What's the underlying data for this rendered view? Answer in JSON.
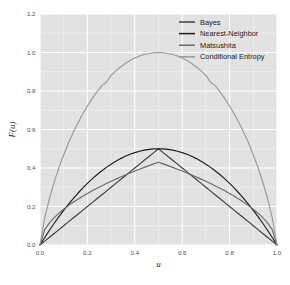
{
  "chart_data": {
    "type": "line",
    "title": "",
    "subtitle": "",
    "xlabel": "u",
    "ylabel": "F(u)",
    "xlim": [
      0.0,
      1.0
    ],
    "ylim": [
      0.0,
      1.2
    ],
    "xticks": [
      "0.0",
      "0.2",
      "0.4",
      "0.6",
      "0.8",
      "1.0"
    ],
    "xtick_values": [
      0.0,
      0.2,
      0.4,
      0.6,
      0.8,
      1.0
    ],
    "yticks": [
      "0.0",
      "0.2",
      "0.4",
      "0.6",
      "0.8",
      "1.0",
      "1.2"
    ],
    "ytick_values": [
      0.0,
      0.2,
      0.4,
      0.6,
      0.8,
      1.0,
      1.2
    ],
    "grid": true,
    "grid_color": "#ffffff",
    "panel_background": "#e2e2e2",
    "legend_position": "top-right-inside",
    "x": [
      0.0,
      0.02,
      0.04,
      0.06,
      0.08,
      0.1,
      0.12,
      0.14,
      0.16,
      0.18,
      0.2,
      0.22,
      0.24,
      0.26,
      0.28,
      0.3,
      0.32,
      0.34,
      0.36,
      0.38,
      0.4,
      0.42,
      0.44,
      0.46,
      0.48,
      0.5,
      0.52,
      0.54,
      0.56,
      0.58,
      0.6,
      0.62,
      0.64,
      0.66,
      0.68,
      0.7,
      0.72,
      0.74,
      0.76,
      0.78,
      0.8,
      0.82,
      0.84,
      0.86,
      0.88,
      0.9,
      0.92,
      0.94,
      0.96,
      0.98,
      1.0
    ],
    "series": [
      {
        "name": "Bayes",
        "color": "#3f3f3f",
        "values": [
          0.0,
          0.02,
          0.04,
          0.06,
          0.08,
          0.1,
          0.12,
          0.14,
          0.16,
          0.18,
          0.2,
          0.22,
          0.24,
          0.26,
          0.28,
          0.3,
          0.32,
          0.34,
          0.36,
          0.38,
          0.4,
          0.42,
          0.44,
          0.46,
          0.48,
          0.5,
          0.48,
          0.46,
          0.44,
          0.42,
          0.4,
          0.38,
          0.36,
          0.34,
          0.32,
          0.3,
          0.28,
          0.26,
          0.24,
          0.22,
          0.2,
          0.18,
          0.16,
          0.14,
          0.12,
          0.1,
          0.08,
          0.06,
          0.04,
          0.02,
          0.0
        ]
      },
      {
        "name": "Nearest-Neighbor",
        "color": "#1c1c1c",
        "values": [
          0.0,
          0.0392,
          0.0768,
          0.1128,
          0.1472,
          0.18,
          0.2112,
          0.2408,
          0.2688,
          0.2952,
          0.32,
          0.3432,
          0.3648,
          0.3848,
          0.4032,
          0.42,
          0.4352,
          0.4488,
          0.4608,
          0.4712,
          0.48,
          0.4872,
          0.4928,
          0.4968,
          0.4992,
          0.5,
          0.4992,
          0.4968,
          0.4928,
          0.4872,
          0.48,
          0.4712,
          0.4608,
          0.4488,
          0.4352,
          0.42,
          0.4032,
          0.3848,
          0.3648,
          0.3432,
          0.32,
          0.2952,
          0.2688,
          0.2408,
          0.2112,
          0.18,
          0.1472,
          0.1128,
          0.0768,
          0.0392,
          0.0
        ]
      },
      {
        "name": "Matsushita",
        "color": "#6b6b6b",
        "values": [
          0.0,
          0.0801,
          0.1149,
          0.1421,
          0.1652,
          0.1858,
          0.2045,
          0.2217,
          0.2379,
          0.2531,
          0.2676,
          0.2813,
          0.2944,
          0.307,
          0.3192,
          0.3309,
          0.3422,
          0.3531,
          0.3637,
          0.374,
          0.384,
          0.3937,
          0.4031,
          0.4123,
          0.4213,
          0.43,
          0.4213,
          0.4123,
          0.4031,
          0.3937,
          0.384,
          0.374,
          0.3637,
          0.3531,
          0.3422,
          0.3309,
          0.3192,
          0.307,
          0.2944,
          0.2813,
          0.2676,
          0.2531,
          0.2379,
          0.2217,
          0.2045,
          0.1858,
          0.1652,
          0.1421,
          0.1149,
          0.0801,
          0.0
        ]
      },
      {
        "name": "Conditional Entropy",
        "color": "#9a9a9a",
        "values": [
          0.0,
          0.1414,
          0.2423,
          0.3274,
          0.4022,
          0.469,
          0.5294,
          0.5842,
          0.6343,
          0.6801,
          0.7219,
          0.7602,
          0.795,
          0.8267,
          0.8454,
          0.8813,
          0.9044,
          0.925,
          0.943,
          0.9585,
          0.971,
          0.9815,
          0.9894,
          0.9948,
          0.9988,
          1.0,
          0.9988,
          0.9948,
          0.9894,
          0.9815,
          0.971,
          0.9585,
          0.943,
          0.925,
          0.9044,
          0.8813,
          0.8454,
          0.8267,
          0.795,
          0.7602,
          0.7219,
          0.6801,
          0.6343,
          0.5842,
          0.5294,
          0.469,
          0.4022,
          0.3274,
          0.2423,
          0.1414,
          0.0
        ]
      }
    ]
  },
  "legend": {
    "items": [
      {
        "label": "Bayes",
        "color": "#3f3f3f"
      },
      {
        "label": "Nearest-Neighbor",
        "color": "#1c1c1c"
      },
      {
        "label": "Matsushita",
        "color": "#6b6b6b"
      },
      {
        "label": "Conditional Entropy",
        "color": "#9a9a9a"
      }
    ]
  }
}
